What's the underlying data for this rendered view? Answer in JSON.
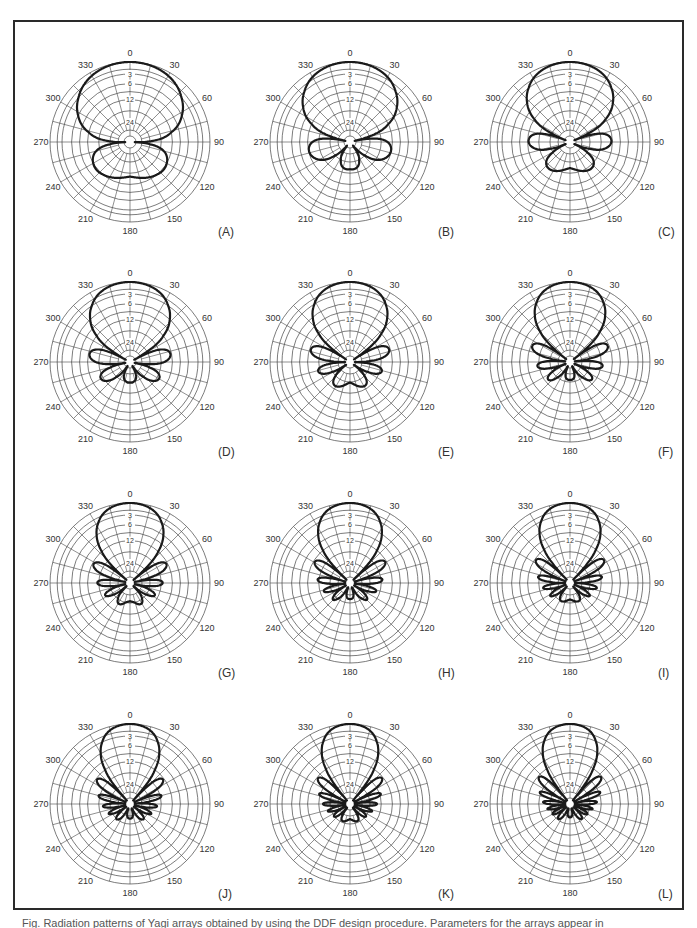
{
  "figure": {
    "caption": "Fig.    Radiation patterns of Yagi arrays obtained by using the DDF design procedure. Parameters for the arrays appear in"
  },
  "chart_data": {
    "type": "polar",
    "grid": {
      "angle_ticks": [
        0,
        30,
        60,
        90,
        120,
        150,
        180,
        210,
        240,
        270,
        300,
        330
      ],
      "spoke_step_deg": 15,
      "db_rings_labeled": [
        "3",
        "6",
        "12",
        "24"
      ],
      "db_levels": [
        0,
        -3,
        -6,
        -12,
        -24
      ]
    },
    "plots": [
      {
        "label": "(A)",
        "elements": 2,
        "description": "broad cardioid main lobe, one back lobe",
        "beamwidth_deg": 150,
        "sidelobe_db": -12
      },
      {
        "label": "(B)",
        "elements": 3,
        "description": "round main lobe, two side lobes, back lobe",
        "beamwidth_deg": 110,
        "sidelobe_db": -14
      },
      {
        "label": "(C)",
        "elements": 4,
        "description": "oval main lobe, small side & back lobes",
        "beamwidth_deg": 80,
        "sidelobe_db": -16
      },
      {
        "label": "(D)",
        "elements": 5,
        "description": "narrow main lobe, flower-like side lobes",
        "beamwidth_deg": 60,
        "sidelobe_db": -16
      },
      {
        "label": "(E)",
        "elements": 6,
        "description": "narrow main lobe, multiple side lobes",
        "beamwidth_deg": 52,
        "sidelobe_db": -17
      },
      {
        "label": "(F)",
        "elements": 7,
        "description": "narrow main lobe, compact side lobes",
        "beamwidth_deg": 46,
        "sidelobe_db": -18
      },
      {
        "label": "(G)",
        "elements": 8,
        "description": "narrow main lobe, many side lobes",
        "beamwidth_deg": 42,
        "sidelobe_db": -18
      },
      {
        "label": "(H)",
        "elements": 9,
        "description": "narrow main lobe, many small side lobes",
        "beamwidth_deg": 38,
        "sidelobe_db": -19
      },
      {
        "label": "(I)",
        "elements": 10,
        "description": "narrow main lobe, many small side lobes",
        "beamwidth_deg": 36,
        "sidelobe_db": -19
      },
      {
        "label": "(J)",
        "elements": 11,
        "description": "very narrow main lobe, dense side lobes",
        "beamwidth_deg": 33,
        "sidelobe_db": -20
      },
      {
        "label": "(K)",
        "elements": 12,
        "description": "very narrow main lobe, dense side lobes",
        "beamwidth_deg": 31,
        "sidelobe_db": -20
      },
      {
        "label": "(L)",
        "elements": 13,
        "description": "very narrow main lobe, dense side lobes",
        "beamwidth_deg": 29,
        "sidelobe_db": -20
      }
    ],
    "layout": {
      "rows": 4,
      "cols": 3,
      "legend": "none"
    }
  }
}
